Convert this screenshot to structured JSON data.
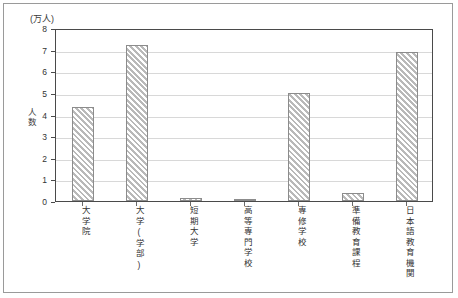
{
  "chart_data": {
    "type": "bar",
    "title": "",
    "unit_caption": "(万人)",
    "ylabel": "人数",
    "xlabel": "",
    "ylim": [
      0,
      8
    ],
    "yticks": [
      0,
      1,
      2,
      3,
      4,
      5,
      6,
      7,
      8
    ],
    "ytick_labels": [
      "0",
      "1",
      "2",
      "3",
      "4",
      "5",
      "6",
      "7",
      "8"
    ],
    "grid": true,
    "legend": "none",
    "categories": [
      "大学院",
      "大学(学部)",
      "短期大学",
      "高等専門学校",
      "専修学校",
      "準備教育課程",
      "日本語教育機関"
    ],
    "values": [
      4.35,
      7.2,
      0.15,
      0.05,
      5.0,
      0.35,
      6.9
    ]
  }
}
